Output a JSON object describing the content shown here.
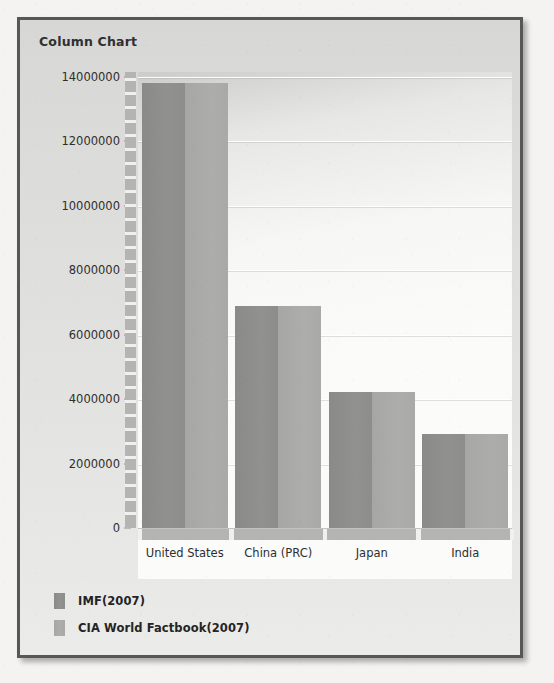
{
  "panel": {
    "title": "Column Chart"
  },
  "legend": {
    "items": [
      {
        "label": "IMF(2007)",
        "color": "#8d8d8b"
      },
      {
        "label": "CIA World Factbook(2007)",
        "color": "#a9a9a7"
      }
    ]
  },
  "axis": {
    "y_ticks": [
      "0",
      "2000000",
      "4000000",
      "6000000",
      "8000000",
      "10000000",
      "12000000",
      "14000000"
    ]
  },
  "chart_data": {
    "type": "bar",
    "title": "Column Chart",
    "xlabel": "",
    "ylabel": "",
    "ylim": [
      0,
      14000000
    ],
    "ytick_step": 2000000,
    "grid": true,
    "legend_position": "bottom-left",
    "categories": [
      "United States",
      "China (PRC)",
      "Japan",
      "India"
    ],
    "series": [
      {
        "name": "IMF(2007)",
        "color": "#8d8d8b",
        "values": [
          13800000,
          6900000,
          4220000,
          2920000
        ]
      },
      {
        "name": "CIA World Factbook(2007)",
        "color": "#a9a9a7",
        "values": [
          13800000,
          6900000,
          4220000,
          2920000
        ]
      }
    ]
  }
}
